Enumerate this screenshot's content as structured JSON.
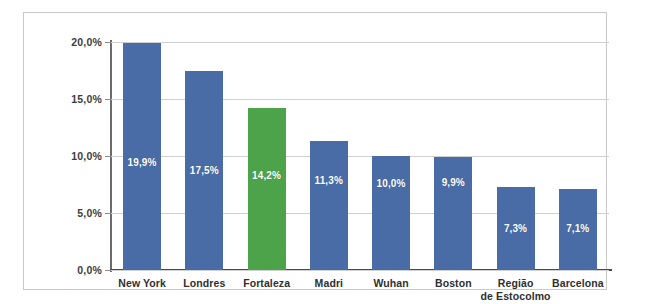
{
  "chart_data": {
    "type": "bar",
    "title": "",
    "xlabel": "",
    "ylabel": "",
    "ylim": [
      0,
      20
    ],
    "grid": true,
    "legend": "none",
    "categories": [
      "New York",
      "Londres",
      "Fortaleza",
      "Madri",
      "Wuhan",
      "Boston",
      "Região de Estocolmo",
      "Barcelona"
    ],
    "category_lines": [
      [
        "New York"
      ],
      [
        "Londres"
      ],
      [
        "Fortaleza"
      ],
      [
        "Madri"
      ],
      [
        "Wuhan"
      ],
      [
        "Boston"
      ],
      [
        "Região",
        "de Estocolmo"
      ],
      [
        "Barcelona"
      ]
    ],
    "values": [
      19.9,
      17.5,
      14.2,
      11.3,
      10.0,
      9.9,
      7.3,
      7.1
    ],
    "data_labels": [
      "19,9%",
      "17,5%",
      "14,2%",
      "11,3%",
      "10,0%",
      "9,9%",
      "7,3%",
      "7,1%"
    ],
    "y_ticks": [
      0,
      5,
      10,
      15,
      20
    ],
    "y_tick_labels": [
      "0,0%",
      "5,0%",
      "10,0%",
      "15,0%",
      "20,0%"
    ],
    "bar_colors": [
      "#4a6ca6",
      "#4a6ca6",
      "#4da34a",
      "#4a6ca6",
      "#4a6ca6",
      "#4a6ca6",
      "#4a6ca6",
      "#4a6ca6"
    ],
    "highlight_index": 2,
    "colors": {
      "bar": "#4a6ca6",
      "highlight": "#4da34a",
      "grid": "#d0d0d0",
      "axis": "#4a4a4a",
      "frame": "#c9c9c9",
      "label_text": "#2f2f2f",
      "value_text": "#ffffff"
    }
  },
  "caption": {
    "text": ""
  }
}
